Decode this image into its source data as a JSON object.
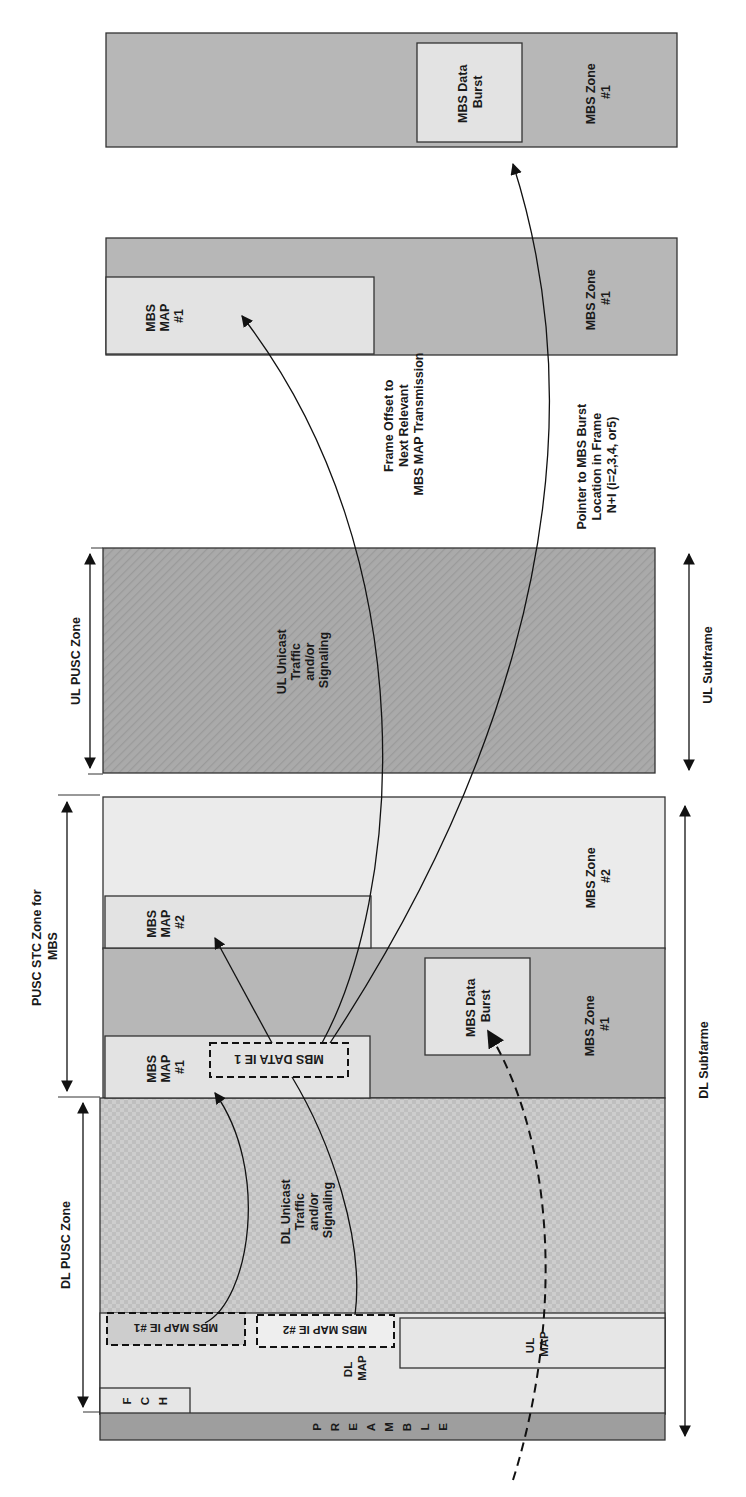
{
  "diagram": {
    "orientation": "rotated 90deg clockwise (text reads bottom-to-top)",
    "colors": {
      "background": "#ffffff",
      "mbs_zone_dark": "#b7b7b7",
      "mbs_zone_light": "#ebebeb",
      "map_box": "#e3e3e3",
      "ul_unicast": "#a9a9a9",
      "dl_unicast": "#c9c9c9",
      "preamble": "#9e9e9e",
      "stroke": "#333333"
    },
    "current_frame": {
      "preamble": {
        "letters": [
          "P",
          "R",
          "E",
          "A",
          "M",
          "B",
          "L",
          "E"
        ]
      },
      "fch": {
        "letters": [
          "F",
          "C",
          "H"
        ]
      },
      "dl_map": {
        "line1": "DL",
        "line2": "MAP"
      },
      "ul_map": {
        "line1": "UL",
        "line2": "MAP"
      },
      "mbs_map_ie_1": "MBS MAP IE #1",
      "mbs_map_ie_2": "MBS MAP IE #2",
      "dl_unicast": {
        "line1": "DL Unicast",
        "line2": "Traffic",
        "line3": "and/or",
        "line4": "Signaling"
      },
      "mbs_map_1": {
        "line1": "MBS",
        "line2": "MAP",
        "line3": "#1"
      },
      "mbs_map_2": {
        "line1": "MBS",
        "line2": "MAP",
        "line3": "#2"
      },
      "mbs_data_ie_1": "MBS DATA IE 1",
      "mbs_data_burst": {
        "line1": "MBS Data",
        "line2": "Burst"
      },
      "mbs_zone_1": {
        "line1": "MBS Zone",
        "line2": "#1"
      },
      "mbs_zone_2": {
        "line1": "MBS Zone",
        "line2": "#2"
      },
      "ul_unicast": {
        "line1": "UL Unicast",
        "line2": "Traffic",
        "line3": "and/or",
        "line4": "Signaling"
      }
    },
    "dimension_labels": {
      "dl_pusc_zone": "DL PUSC Zone",
      "pusc_stc_zone": {
        "line1": "PUSC STC Zone for",
        "line2": "MBS"
      },
      "ul_pusc_zone": "UL PUSC Zone",
      "dl_subframe": "DL Subfarme",
      "ul_subframe": "UL Subframe"
    },
    "next_map_frame": {
      "mbs_map_1": {
        "line1": "MBS",
        "line2": "MAP",
        "line3": "#1"
      },
      "mbs_zone_1": {
        "line1": "MBS Zone",
        "line2": "#1"
      }
    },
    "data_burst_frame": {
      "mbs_data_burst": {
        "line1": "MBS Data",
        "line2": "Burst"
      },
      "mbs_zone_1": {
        "line1": "MBS Zone",
        "line2": "#1"
      }
    },
    "annotations": {
      "frame_offset": {
        "line1": "Frame Offset to",
        "line2": "Next Relevant",
        "line3": "MBS MAP Transmission"
      },
      "pointer": {
        "line1": "Pointer to MBS Burst",
        "line2": "Location in Frame",
        "line3": "N+I (i=2,3,4, or5)"
      }
    }
  }
}
